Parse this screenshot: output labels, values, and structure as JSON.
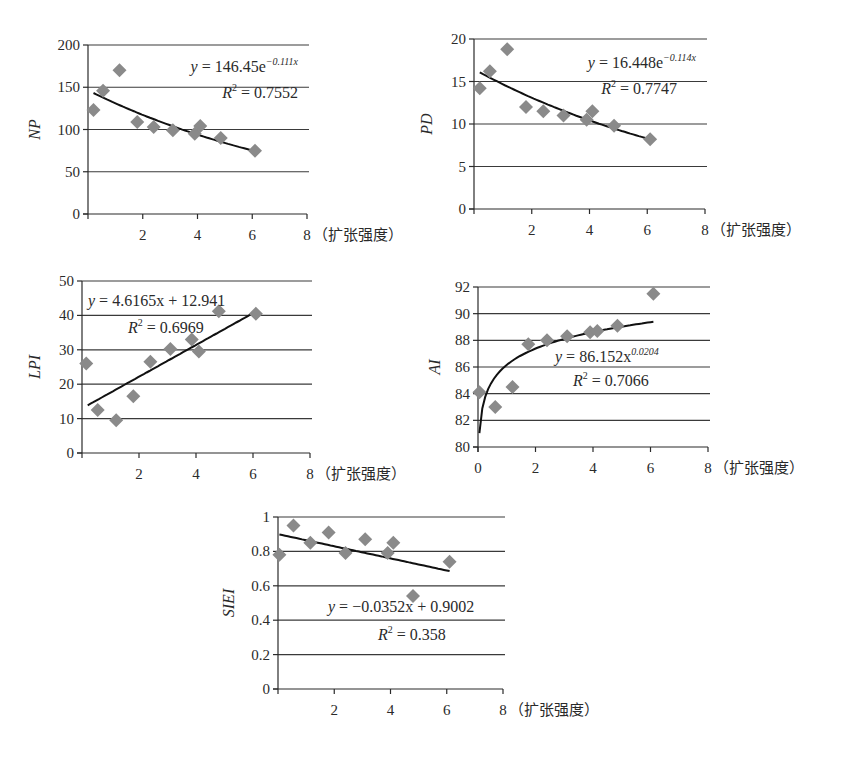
{
  "xunit_label": "（扩张强度）",
  "chart_data": [
    {
      "id": "np",
      "type": "scatter",
      "title": "",
      "xlabel": "扩张强度",
      "ylabel": "NP",
      "xlim": [
        0,
        8
      ],
      "ylim": [
        0,
        200
      ],
      "xticks": [
        2,
        4,
        6,
        8
      ],
      "xtick_labels": [
        "2",
        "4",
        "6",
        "8"
      ],
      "yticks": [
        0,
        50,
        100,
        150,
        200
      ],
      "ytick_labels": [
        "0",
        "50",
        "100",
        "150",
        "200"
      ],
      "grid": true,
      "points": [
        [
          0.2,
          123
        ],
        [
          0.55,
          146
        ],
        [
          1.15,
          170
        ],
        [
          1.8,
          109
        ],
        [
          2.4,
          103
        ],
        [
          3.1,
          99
        ],
        [
          3.9,
          95
        ],
        [
          4.1,
          104
        ],
        [
          4.85,
          90
        ],
        [
          6.1,
          75
        ]
      ],
      "trendline": {
        "kind": "exponential",
        "a": 146.45,
        "b": -0.111,
        "x_range": [
          0.2,
          6.1
        ]
      },
      "equation": {
        "prefix": "y = 146.45e",
        "sup": "−0.111x"
      },
      "r2": {
        "prefix": "R",
        "sup": "2",
        "value": " = 0.7552"
      },
      "legend": "none"
    },
    {
      "id": "pd",
      "type": "scatter",
      "title": "",
      "xlabel": "扩张强度",
      "ylabel": "PD",
      "xlim": [
        0,
        8
      ],
      "ylim": [
        0,
        20
      ],
      "xticks": [
        2,
        4,
        6,
        8
      ],
      "xtick_labels": [
        "2",
        "4",
        "6",
        "8"
      ],
      "yticks": [
        0,
        5,
        10,
        15,
        20
      ],
      "ytick_labels": [
        "0",
        "5",
        "10",
        "15",
        "20"
      ],
      "grid": true,
      "points": [
        [
          0.2,
          14.2
        ],
        [
          0.55,
          16.2
        ],
        [
          1.15,
          18.8
        ],
        [
          1.8,
          12
        ],
        [
          2.4,
          11.5
        ],
        [
          3.1,
          11
        ],
        [
          3.9,
          10.5
        ],
        [
          4.1,
          11.5
        ],
        [
          4.85,
          9.8
        ],
        [
          6.1,
          8.2
        ]
      ],
      "trendline": {
        "kind": "exponential",
        "a": 16.448,
        "b": -0.114,
        "x_range": [
          0.2,
          6.1
        ]
      },
      "equation": {
        "prefix": "y = 16.448e",
        "sup": "−0.114x"
      },
      "r2": {
        "prefix": "R",
        "sup": "2",
        "value": " = 0.7747"
      },
      "legend": "none"
    },
    {
      "id": "lpi",
      "type": "scatter",
      "title": "",
      "xlabel": "扩张强度",
      "ylabel": "LPI",
      "xlim": [
        0,
        8
      ],
      "ylim": [
        0,
        50
      ],
      "xticks": [
        2,
        4,
        6,
        8
      ],
      "xtick_labels": [
        "2",
        "4",
        "6",
        "8"
      ],
      "yticks": [
        0,
        10,
        20,
        30,
        40,
        50
      ],
      "ytick_labels": [
        "0",
        "10",
        "20",
        "30",
        "40",
        "50"
      ],
      "grid": true,
      "points": [
        [
          0.15,
          26
        ],
        [
          0.55,
          12.5
        ],
        [
          1.2,
          9.5
        ],
        [
          1.8,
          16.5
        ],
        [
          2.4,
          26.5
        ],
        [
          3.1,
          30.2
        ],
        [
          3.85,
          33
        ],
        [
          4.1,
          29.5
        ],
        [
          4.8,
          41.2
        ],
        [
          6.1,
          40.5
        ]
      ],
      "trendline": {
        "kind": "linear",
        "m": 4.6165,
        "c": 12.941,
        "x_range": [
          0.2,
          6.1
        ]
      },
      "equation": {
        "prefix": "y = 4.6165x + 12.941",
        "sup": ""
      },
      "r2": {
        "prefix": "R",
        "sup": "2",
        "value": " = 0.6969"
      },
      "legend": "none"
    },
    {
      "id": "ai",
      "type": "scatter",
      "title": "",
      "xlabel": "扩张强度",
      "ylabel": "AI",
      "xlim": [
        0,
        8
      ],
      "ylim": [
        80,
        92
      ],
      "xticks": [
        0,
        2,
        4,
        6,
        8
      ],
      "xtick_labels": [
        "0",
        "2",
        "4",
        "6",
        "8"
      ],
      "yticks": [
        80,
        82,
        84,
        86,
        88,
        90,
        92
      ],
      "ytick_labels": [
        "80",
        "82",
        "84",
        "86",
        "88",
        "90",
        "92"
      ],
      "grid": true,
      "points": [
        [
          0.05,
          84.1
        ],
        [
          0.6,
          83
        ],
        [
          1.2,
          84.5
        ],
        [
          1.75,
          87.7
        ],
        [
          2.4,
          88
        ],
        [
          3.1,
          88.3
        ],
        [
          3.9,
          88.6
        ],
        [
          4.15,
          88.7
        ],
        [
          4.85,
          89.1
        ],
        [
          6.1,
          91.5
        ]
      ],
      "trendline": {
        "kind": "power",
        "a": 86.152,
        "b": 0.0204,
        "x_range": [
          0.05,
          6.1
        ]
      },
      "equation": {
        "prefix": "y = 86.152x",
        "sup": "0.0204"
      },
      "r2": {
        "prefix": "R",
        "sup": "2",
        "value": " = 0.7066"
      },
      "legend": "none"
    },
    {
      "id": "siei",
      "type": "scatter",
      "title": "",
      "xlabel": "扩张强度",
      "ylabel": "SIEI",
      "xlim": [
        0,
        8
      ],
      "ylim": [
        0,
        1
      ],
      "xticks": [
        2,
        4,
        6,
        8
      ],
      "xtick_labels": [
        "2",
        "4",
        "6",
        "8"
      ],
      "yticks": [
        0,
        0.2,
        0.4,
        0.6,
        0.8,
        1
      ],
      "ytick_labels": [
        "0",
        "0.2",
        "0.4",
        "0.6",
        "0.8",
        "1"
      ],
      "grid": true,
      "points": [
        [
          0.05,
          0.78
        ],
        [
          0.55,
          0.95
        ],
        [
          1.15,
          0.85
        ],
        [
          1.8,
          0.91
        ],
        [
          2.4,
          0.79
        ],
        [
          3.1,
          0.87
        ],
        [
          3.9,
          0.79
        ],
        [
          4.1,
          0.85
        ],
        [
          4.8,
          0.54
        ],
        [
          6.1,
          0.74
        ]
      ],
      "trendline": {
        "kind": "linear",
        "m": -0.0352,
        "c": 0.9002,
        "x_range": [
          0.05,
          6.1
        ]
      },
      "equation": {
        "prefix": "y = −0.0352x + 0.9002",
        "sup": ""
      },
      "r2": {
        "prefix": "R",
        "sup": "2",
        "value": " = 0.358"
      },
      "legend": "none"
    }
  ]
}
